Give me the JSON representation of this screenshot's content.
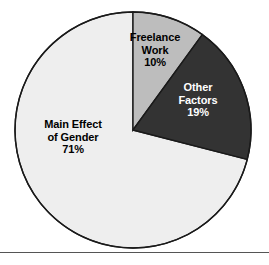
{
  "chart_data": {
    "type": "pie",
    "title": "",
    "subtitle": "",
    "xlabel": "",
    "ylabel": "",
    "legend_position": "none",
    "grid": false,
    "start_angle_deg": 0,
    "direction": "clockwise",
    "categories": [
      "Freelance Work",
      "Other Factors",
      "Main Effect of Gender"
    ],
    "values": [
      10,
      19,
      71
    ],
    "value_unit": "%",
    "slices": [
      {
        "label": "Freelance Work",
        "label_lines": [
          "Freelance",
          "Work"
        ],
        "value": 10,
        "value_label": "10%",
        "color": "#bdbdbd",
        "text_color": "#000000",
        "start_deg": 0,
        "end_deg": 36
      },
      {
        "label": "Other Factors",
        "label_lines": [
          "Other",
          "Factors"
        ],
        "value": 19,
        "value_label": "19%",
        "color": "#333333",
        "text_color": "#ffffff",
        "start_deg": 36,
        "end_deg": 104.4
      },
      {
        "label": "Main Effect of Gender",
        "label_lines": [
          "Main Effect",
          "of Gender"
        ],
        "value": 71,
        "value_label": "71%",
        "color": "#eeeeee",
        "text_color": "#000000",
        "start_deg": 104.4,
        "end_deg": 360
      }
    ],
    "outline_color": "#1a1a1a",
    "background_color": "#ffffff"
  },
  "figure": {
    "rule_color": "#555555"
  }
}
